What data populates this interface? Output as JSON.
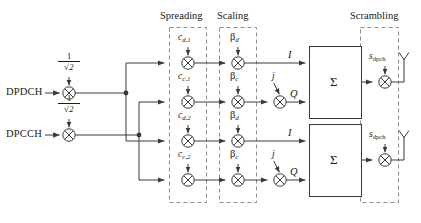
{
  "figure": {
    "width": 421,
    "height": 223,
    "line_color": "#3a3a3a",
    "text_color": "#1a1a1a",
    "dash_color": "#8a8a8a"
  },
  "inputs": [
    {
      "label": "DPDCH",
      "gain_numerator": "1",
      "gain_denominator": "2",
      "gain_radical": "√"
    },
    {
      "label": "DPCCH",
      "gain_numerator": "1",
      "gain_denominator": "2",
      "gain_radical": "√"
    }
  ],
  "sections": {
    "spreading": "Spreading",
    "scaling": "Scaling",
    "scrambling": "Scrambling"
  },
  "branches": [
    {
      "index": 0,
      "spreading_code": "c",
      "spreading_sub": "d,1",
      "scaling_gain": "β",
      "scaling_sub": "d",
      "rail": "I",
      "has_j": false
    },
    {
      "index": 1,
      "spreading_code": "c",
      "spreading_sub": "c,1",
      "scaling_gain": "β",
      "scaling_sub": "c",
      "rail": "Q",
      "has_j": true,
      "j_label": "j"
    },
    {
      "index": 2,
      "spreading_code": "c",
      "spreading_sub": "d,2",
      "scaling_gain": "β",
      "scaling_sub": "d",
      "rail": "I",
      "has_j": false
    },
    {
      "index": 3,
      "spreading_code": "c",
      "spreading_sub": "c,2",
      "scaling_gain": "β",
      "scaling_sub": "c",
      "rail": "Q",
      "has_j": true,
      "j_label": "j"
    }
  ],
  "summers": [
    {
      "index": 0,
      "symbol": "Σ"
    },
    {
      "index": 1,
      "symbol": "Σ"
    }
  ],
  "scramblers": [
    {
      "index": 0,
      "code": "s",
      "code_sub": "dpch"
    },
    {
      "index": 1,
      "code": "s",
      "code_sub": "dpch"
    }
  ],
  "icons": {
    "multiplier": "circle-times-icon",
    "antenna": "antenna-icon",
    "junction": "junction-dot-icon",
    "arrow": "arrow-head-icon"
  }
}
